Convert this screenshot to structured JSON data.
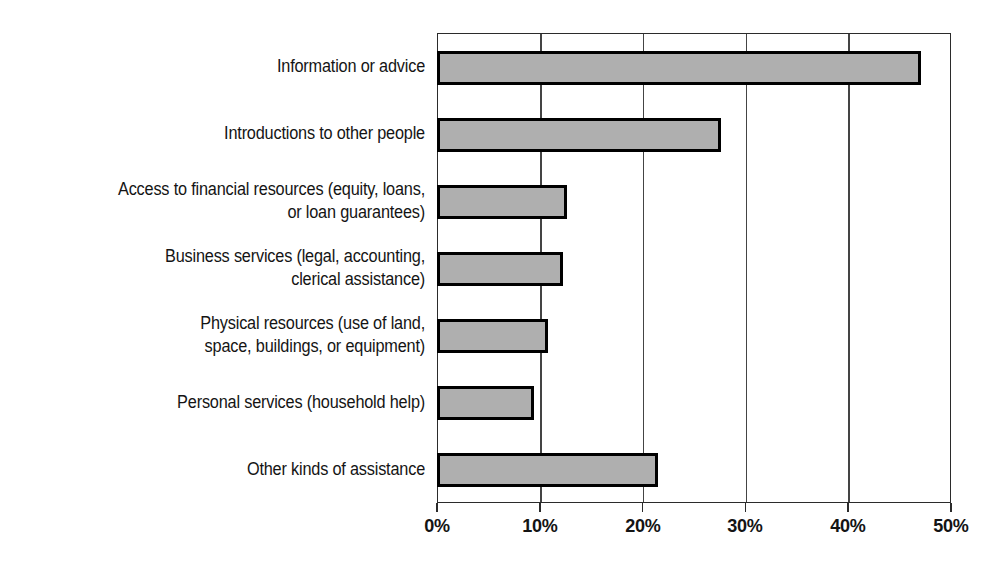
{
  "chart_data": {
    "type": "bar",
    "orientation": "horizontal",
    "title": "",
    "subtitle": "",
    "xlabel": "",
    "ylabel": "",
    "xlim": [
      0,
      50
    ],
    "xtick_values": [
      0,
      10,
      20,
      30,
      40,
      50
    ],
    "xtick_labels": [
      "0%",
      "10%",
      "20%",
      "30%",
      "40%",
      "50%"
    ],
    "grid": true,
    "grid_axis": "x",
    "legend": false,
    "legend_position": "none",
    "value_unit": "percent",
    "categories": [
      "Information or advice",
      "Introductions to other people",
      "Access to financial resources (equity, loans,\nor loan guarantees)",
      "Business services (legal, accounting,\nclerical assistance)",
      "Physical resources (use of land,\nspace, buildings, or equipment)",
      "Personal services (household help)",
      "Other kinds of assistance"
    ],
    "values": [
      47.0,
      27.5,
      12.5,
      12.2,
      10.7,
      9.3,
      21.4
    ],
    "bar_fill_color": "#afafaf",
    "bar_edge_color": "#000000",
    "axis_color": "#2b2b2b",
    "background_color": "#ffffff"
  }
}
